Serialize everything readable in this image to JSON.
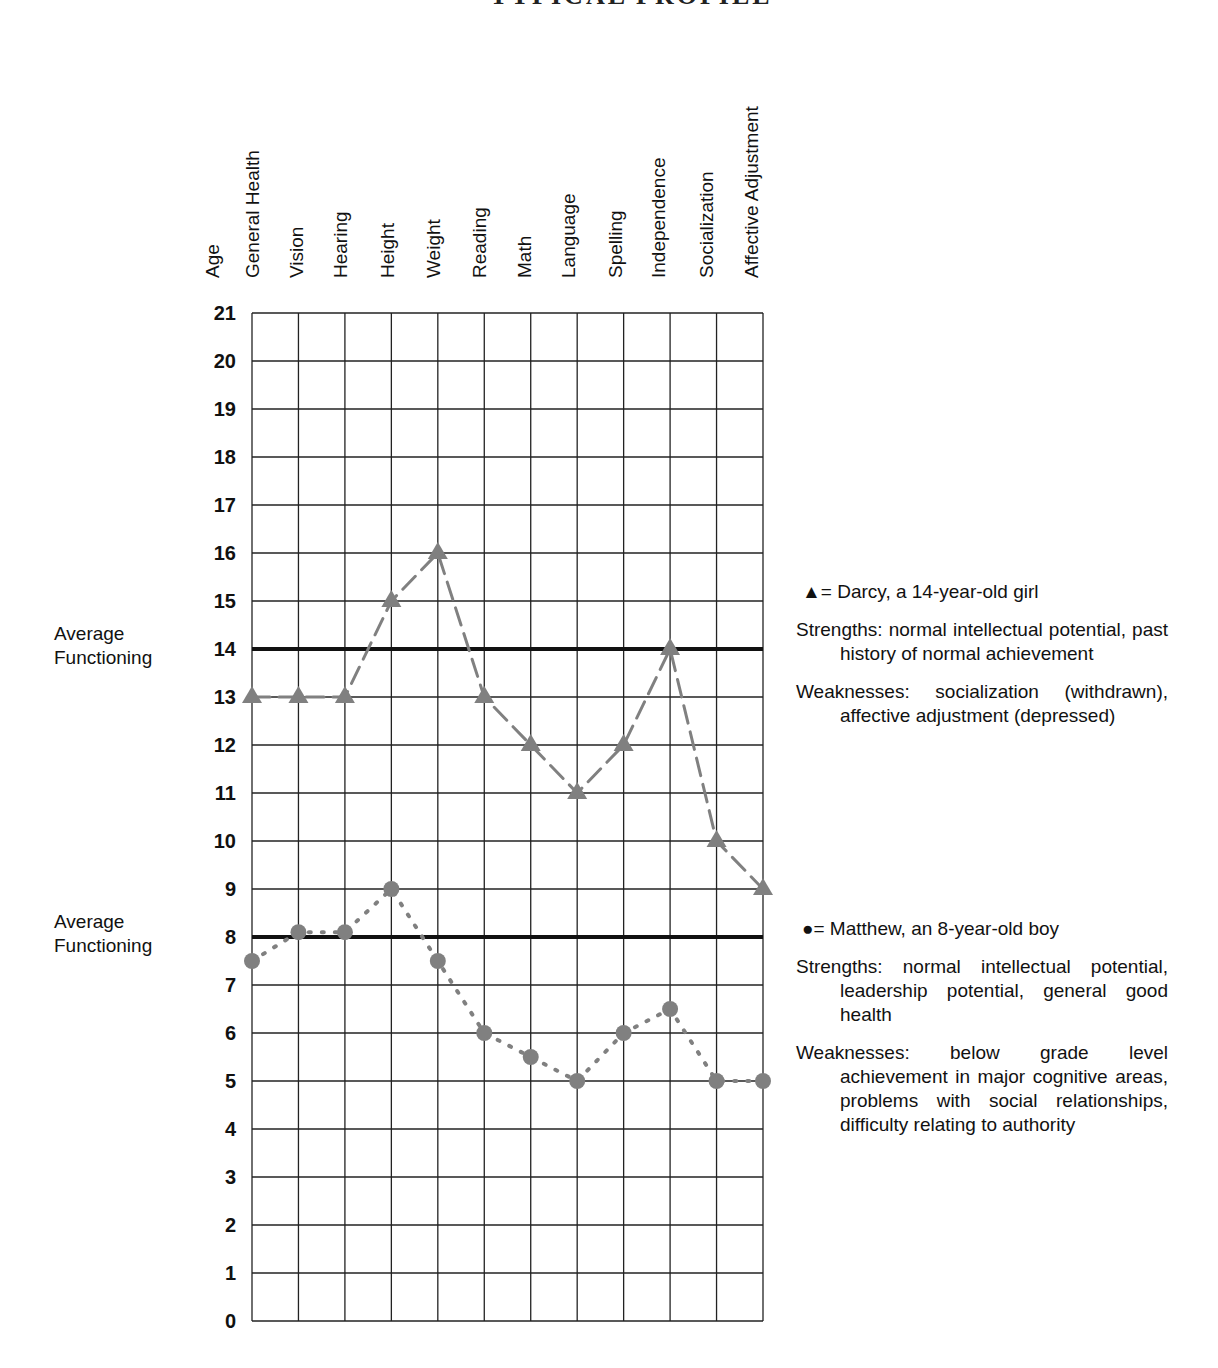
{
  "title_fragment": "TYPICAL PROFILE",
  "y_axis_label": "Age",
  "columns": [
    "General Health",
    "Vision",
    "Hearing",
    "Height",
    "Weight",
    "Reading",
    "Math",
    "Language",
    "Spelling",
    "Independence",
    "Socialization",
    "Affective Adjustment"
  ],
  "y_ticks": [
    "21",
    "20",
    "19",
    "18",
    "17",
    "16",
    "15",
    "14",
    "13",
    "12",
    "11",
    "10",
    "9",
    "8",
    "7",
    "6",
    "5",
    "4",
    "3",
    "2",
    "1",
    "0"
  ],
  "average_labels": {
    "upper": {
      "line1": "Average",
      "line2": "Functioning"
    },
    "lower": {
      "line1": "Average",
      "line2": "Functioning"
    }
  },
  "legend": {
    "darcy": {
      "symbol": "▲",
      "key": "= Darcy, a 14-year-old girl",
      "strengths": "Strengths: normal intellectual potential, past history of normal achievement",
      "weaknesses": "Weaknesses: socialization (withdrawn), affective adjustment (depressed)"
    },
    "matthew": {
      "symbol": "●",
      "key": "= Matthew, an 8-year-old boy",
      "strengths": "Strengths: normal intellectual potential, leadership potential, general good health",
      "weaknesses": "Weaknesses: below grade level achievement in major cognitive areas, problems with social relationships, difficulty relating to authority"
    }
  },
  "colors": {
    "grid": "#222222",
    "average_line": "#111111",
    "series": "#808080"
  },
  "chart_data": {
    "type": "line",
    "title": "",
    "xlabel": "",
    "ylabel": "Age",
    "categories": [
      "General Health",
      "Vision",
      "Hearing",
      "Height",
      "Weight",
      "Reading",
      "Math",
      "Language",
      "Spelling",
      "Independence",
      "Socialization",
      "Affective Adjustment"
    ],
    "ylim": [
      0,
      21
    ],
    "grid": true,
    "series": [
      {
        "name": "Darcy, a 14-year-old girl",
        "marker": "triangle",
        "line_style": "dashed",
        "values": [
          13,
          13,
          13,
          15,
          16,
          13,
          12,
          11,
          12,
          14,
          10,
          9
        ]
      },
      {
        "name": "Matthew, an 8-year-old boy",
        "marker": "circle",
        "line_style": "dotted",
        "values": [
          7.5,
          8.1,
          8.1,
          9,
          7.5,
          6,
          5.5,
          5,
          6,
          6.5,
          5,
          5
        ]
      }
    ],
    "reference_lines": [
      {
        "label": "Average Functioning",
        "y": 14
      },
      {
        "label": "Average Functioning",
        "y": 8
      }
    ],
    "legend_position": "right"
  }
}
